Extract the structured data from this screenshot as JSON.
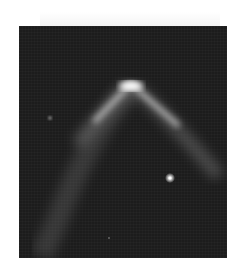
{
  "image": {
    "subject": "astronomical-arc",
    "description": "Dark sky field with a bright chevron-shaped luminous arc, a diffuse tail extending to the lower left, a bright point star and faint background stars",
    "colors": {
      "background": "#1c1c1c",
      "arc_core": "#ffffff",
      "arc_glow": "#bdbdbd",
      "star": "#ffffff"
    },
    "features": {
      "arc_apex": {
        "x": 112,
        "y": 60
      },
      "bright_star": {
        "x": 151,
        "y": 152
      },
      "faint_star": {
        "x": 31,
        "y": 92
      }
    }
  }
}
